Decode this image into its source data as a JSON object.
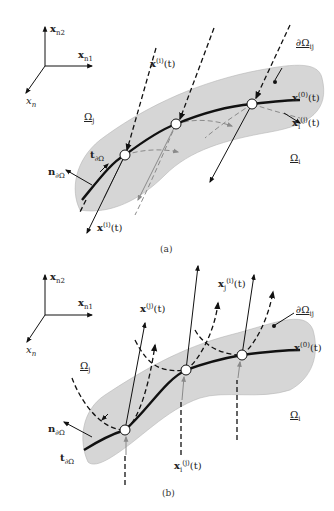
{
  "figure": {
    "panels": [
      {
        "id": "a",
        "caption": "(a)",
        "axes": {
          "up": "x_{n2}",
          "right": "x_{n1}",
          "out": "x_n"
        },
        "labels": {
          "omega_j": "Ω_j",
          "omega_i": "Ω_i",
          "boundary": "∂Ω_ij",
          "x0": "x^(0)(t)",
          "xj_i": "x_j^(i)(t)",
          "xi_j": "x_i^(j)(t)",
          "xi": "x^(i)(t)",
          "tangent": "t_∂Ωij",
          "normal": "n_∂Ωij"
        }
      },
      {
        "id": "b",
        "caption": "(b)",
        "axes": {
          "up": "x_{n2}",
          "right": "x_{n1}",
          "out": "x_n"
        },
        "labels": {
          "omega_j": "Ω_j",
          "omega_i": "Ω_i",
          "boundary": "∂Ω_ij",
          "x0": "x^(0)(t)",
          "xj": "x^(j)(t)",
          "xj_i": "x_j^(i)(t)",
          "xi_j": "x_i^(j)(t)",
          "tangent": "t_∂Ωij",
          "normal": "n_∂Ωij"
        }
      }
    ],
    "colors": {
      "region_fill": "#d6d6d6",
      "curve": "#111111",
      "grey_flow": "#8a8a8a",
      "node_fill": "#ffffff"
    },
    "text": {
      "a_caption": "(a)",
      "b_caption": "(b)",
      "x": "x",
      "n": "n",
      "t": "t",
      "sub_n1": "n",
      "sub_1": "1",
      "sub_2": "2",
      "omega": "Ω",
      "sub_i": "i",
      "sub_j": "j",
      "partial_omega": "∂Ω",
      "sub_ij": "ij",
      "sup_0": "(0)",
      "sup_i": "(i)",
      "sup_j": "(j)",
      "arg_t": "(t)"
    }
  }
}
